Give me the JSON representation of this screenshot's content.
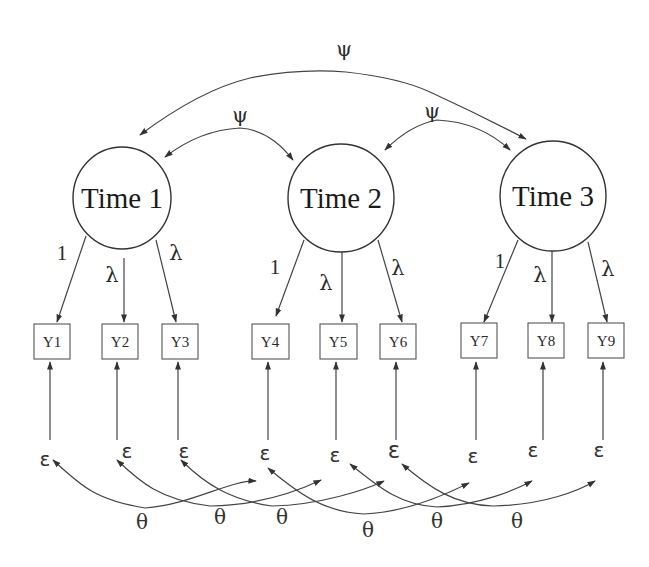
{
  "diagram": {
    "type": "longitudinal-cfa-path-diagram",
    "latent_factors": [
      {
        "id": "T1",
        "label": "Time 1",
        "cx": 122,
        "cy": 198,
        "r": 50
      },
      {
        "id": "T2",
        "label": "Time 2",
        "cx": 341,
        "cy": 198,
        "r": 53
      },
      {
        "id": "T3",
        "label": "Time 3",
        "cx": 553,
        "cy": 196,
        "r": 53
      }
    ],
    "indicators": [
      {
        "id": "Y1",
        "label": "Y1",
        "factor": "T1",
        "x": 34,
        "loading": "1"
      },
      {
        "id": "Y2",
        "label": "Y2",
        "factor": "T1",
        "x": 102,
        "loading": "λ"
      },
      {
        "id": "Y3",
        "label": "Y3",
        "factor": "T1",
        "x": 162,
        "loading": "λ"
      },
      {
        "id": "Y4",
        "label": "Y4",
        "factor": "T2",
        "x": 252,
        "loading": "1"
      },
      {
        "id": "Y5",
        "label": "Y5",
        "factor": "T2",
        "x": 320,
        "loading": "λ"
      },
      {
        "id": "Y6",
        "label": "Y6",
        "factor": "T2",
        "x": 380,
        "loading": "λ"
      },
      {
        "id": "Y7",
        "label": "Y7",
        "factor": "T3",
        "x": 461,
        "loading": "1"
      },
      {
        "id": "Y8",
        "label": "Y8",
        "factor": "T3",
        "x": 528,
        "loading": "λ"
      },
      {
        "id": "Y9",
        "label": "Y9",
        "factor": "T3",
        "x": 588,
        "loading": "λ"
      }
    ],
    "factor_covariances": [
      {
        "from": "T1",
        "to": "T2",
        "label": "ψ"
      },
      {
        "from": "T2",
        "to": "T3",
        "label": "ψ"
      },
      {
        "from": "T1",
        "to": "T3",
        "label": "ψ"
      }
    ],
    "error_terms": [
      "ε",
      "ε",
      "ε",
      "ε",
      "ε",
      "ε",
      "ε",
      "ε",
      "ε"
    ],
    "error_covariances": [
      {
        "from": "ε1",
        "to": "ε4",
        "label": "θ"
      },
      {
        "from": "ε2",
        "to": "ε5",
        "label": "θ"
      },
      {
        "from": "ε3",
        "to": "ε6",
        "label": "θ"
      },
      {
        "from": "ε4",
        "to": "ε7",
        "label": "θ"
      },
      {
        "from": "ε5",
        "to": "ε8",
        "label": "θ"
      },
      {
        "from": "ε6",
        "to": "ε9",
        "label": "θ"
      }
    ]
  },
  "labels": {
    "psi_top": "ψ",
    "psi_left": "ψ",
    "psi_right": "ψ",
    "time1": "Time 1",
    "time2": "Time 2",
    "time3": "Time 3",
    "load": [
      "1",
      "λ",
      "λ",
      "1",
      "λ",
      "λ",
      "1",
      "λ",
      "λ"
    ],
    "y": [
      "Y1",
      "Y2",
      "Y3",
      "Y4",
      "Y5",
      "Y6",
      "Y7",
      "Y8",
      "Y9"
    ],
    "eps": [
      "ε",
      "ε",
      "ε",
      "ε",
      "ε",
      "ε",
      "ε",
      "ε",
      "ε"
    ],
    "theta": [
      "θ",
      "θ",
      "θ",
      "θ",
      "θ",
      "θ"
    ]
  }
}
